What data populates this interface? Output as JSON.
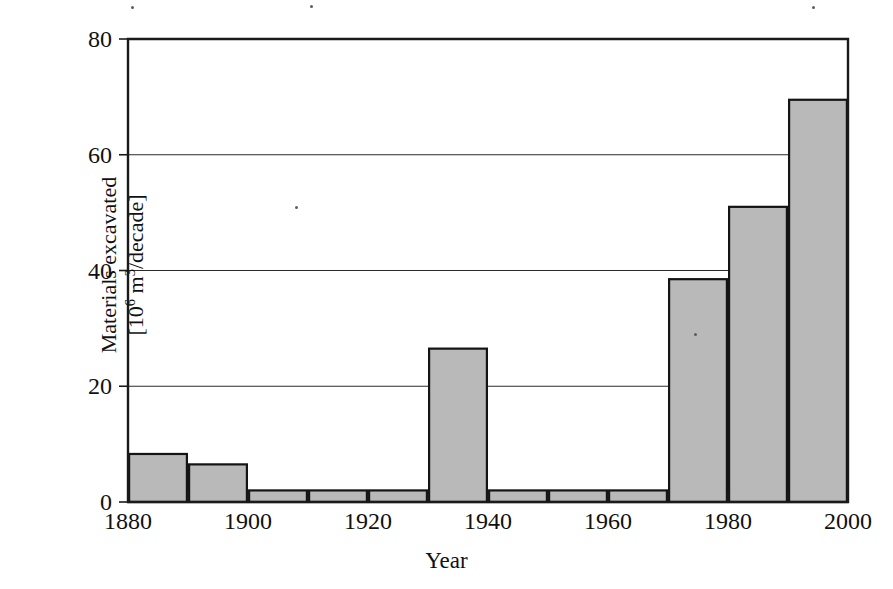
{
  "figure": {
    "background_color": "#ffffff",
    "bar_fill_color": "#b9b9b9",
    "bar_edge_color": "#141414",
    "axis_color": "#1a1a1a"
  },
  "chart_data": {
    "type": "bar",
    "title": "",
    "subtitle": "",
    "xlabel": "Year",
    "ylabel_line1": "Materials excavated",
    "ylabel_line2_prefix": "[10",
    "ylabel_line2_sup1": "6",
    "ylabel_line2_mid": " m",
    "ylabel_line2_sup2": "3",
    "ylabel_line2_suffix": "/decade]",
    "ylabel": "Materials excavated [10^6 m^3/decade]",
    "categories": [
      "1880",
      "1890",
      "1900",
      "1910",
      "1920",
      "1930",
      "1940",
      "1950",
      "1960",
      "1970",
      "1980",
      "1990"
    ],
    "bar_start_years": [
      1880,
      1890,
      1900,
      1910,
      1920,
      1930,
      1940,
      1950,
      1960,
      1970,
      1980,
      1990
    ],
    "bar_end_years": [
      1890,
      1900,
      1910,
      1920,
      1930,
      1940,
      1950,
      1960,
      1970,
      1980,
      1990,
      2000
    ],
    "values": [
      8.3,
      6.5,
      2.0,
      2.0,
      2.0,
      26.5,
      2.0,
      2.0,
      2.0,
      38.5,
      51.0,
      69.5
    ],
    "xlim": [
      1880,
      2000
    ],
    "ylim": [
      0,
      80
    ],
    "x_tick_labels": [
      "1880",
      "1900",
      "1920",
      "1940",
      "1960",
      "1980",
      "2000"
    ],
    "x_tick_values": [
      1880,
      1900,
      1920,
      1940,
      1960,
      1980,
      2000
    ],
    "x_minor_tick_values": [
      1890,
      1910,
      1930,
      1950,
      1970,
      1990
    ],
    "y_tick_labels": [
      "0",
      "20",
      "40",
      "60",
      "80"
    ],
    "y_tick_values": [
      0,
      20,
      40,
      60,
      80
    ],
    "grid": "horizontal",
    "legend": "none",
    "legend_position": "none",
    "annotations": []
  }
}
